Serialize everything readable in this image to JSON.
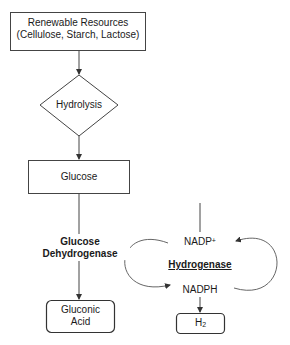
{
  "diagram": {
    "nodes": {
      "renewable_resources": {
        "line1": "Renewable Resources",
        "line2": "(Cellulose, Starch, Lactose)",
        "shape": "rectangle"
      },
      "hydrolysis": {
        "label": "Hydrolysis",
        "shape": "diamond"
      },
      "glucose": {
        "label": "Glucose",
        "shape": "rectangle"
      },
      "gluconic_acid": {
        "line1": "Gluconic",
        "line2": "Acid",
        "shape": "rounded-rectangle"
      },
      "h2": {
        "base": "H",
        "subscript": "2",
        "shape": "rounded-rectangle"
      }
    },
    "labels": {
      "glucose_dehydrogenase_line1": "Glucose",
      "glucose_dehydrogenase_line2": "Dehydrogenase",
      "nadp_base": "NADP",
      "nadp_superscript": "+",
      "hydrogenase": "Hydrogenase",
      "nadph": "NADPH"
    },
    "edges": [
      {
        "from": "renewable_resources",
        "to": "hydrolysis"
      },
      {
        "from": "hydrolysis",
        "to": "glucose"
      },
      {
        "from": "glucose",
        "to": "gluconic_acid",
        "label": "Glucose Dehydrogenase"
      },
      {
        "from": "NADP+",
        "to": "NADPH",
        "type": "cycle-arc-left"
      },
      {
        "from": "NADPH",
        "to": "NADP+",
        "type": "cycle-arc-right"
      },
      {
        "from": "NADPH",
        "to": "h2"
      }
    ],
    "colors": {
      "line": "#333333",
      "text": "#1a1a1a",
      "background": "#ffffff"
    }
  }
}
